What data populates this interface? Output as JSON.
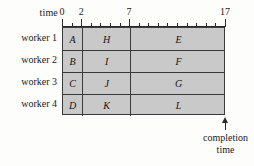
{
  "figure": {
    "time_axis_label": "time",
    "completion_label_line1": "completion",
    "completion_label_line2": "time",
    "arrow_icon": "up-arrow-icon",
    "colors": {
      "bar_fill": "#c9c9c9",
      "border": "#3a3a3a",
      "axis": "#2b2b2b",
      "text": "#1a1a1a",
      "background": "#fdfdfc"
    }
  },
  "chart_data": {
    "type": "bar",
    "title": "",
    "subtitle": "",
    "xlabel": "time",
    "ylabel": "",
    "orientation": "horizontal",
    "style": "gantt",
    "grid": false,
    "legend": null,
    "xlim": [
      0,
      17
    ],
    "x_tick_labels": [
      "0",
      "2",
      "7",
      "17"
    ],
    "x_tick_values": [
      0,
      2,
      7,
      17
    ],
    "x_minor_tick_step": 1,
    "categories": [
      "worker 1",
      "worker 2",
      "worker 3",
      "worker 4"
    ],
    "rows": [
      {
        "label": "worker 1",
        "tasks": [
          {
            "name": "A",
            "start": 0,
            "end": 2,
            "duration": 2
          },
          {
            "name": "H",
            "start": 2,
            "end": 7,
            "duration": 5
          },
          {
            "name": "E",
            "start": 7,
            "end": 17,
            "duration": 10
          }
        ]
      },
      {
        "label": "worker 2",
        "tasks": [
          {
            "name": "B",
            "start": 0,
            "end": 2,
            "duration": 2
          },
          {
            "name": "I",
            "start": 2,
            "end": 7,
            "duration": 5
          },
          {
            "name": "F",
            "start": 7,
            "end": 17,
            "duration": 10
          }
        ]
      },
      {
        "label": "worker 3",
        "tasks": [
          {
            "name": "C",
            "start": 0,
            "end": 2,
            "duration": 2
          },
          {
            "name": "J",
            "start": 2,
            "end": 7,
            "duration": 5
          },
          {
            "name": "G",
            "start": 7,
            "end": 17,
            "duration": 10
          }
        ]
      },
      {
        "label": "worker 4",
        "tasks": [
          {
            "name": "D",
            "start": 0,
            "end": 2,
            "duration": 2
          },
          {
            "name": "K",
            "start": 2,
            "end": 7,
            "duration": 5
          },
          {
            "name": "L",
            "start": 7,
            "end": 17,
            "duration": 10
          }
        ]
      }
    ],
    "annotations": [
      {
        "text": "completion time",
        "at_x": 17,
        "marker": "up-arrow"
      }
    ]
  }
}
